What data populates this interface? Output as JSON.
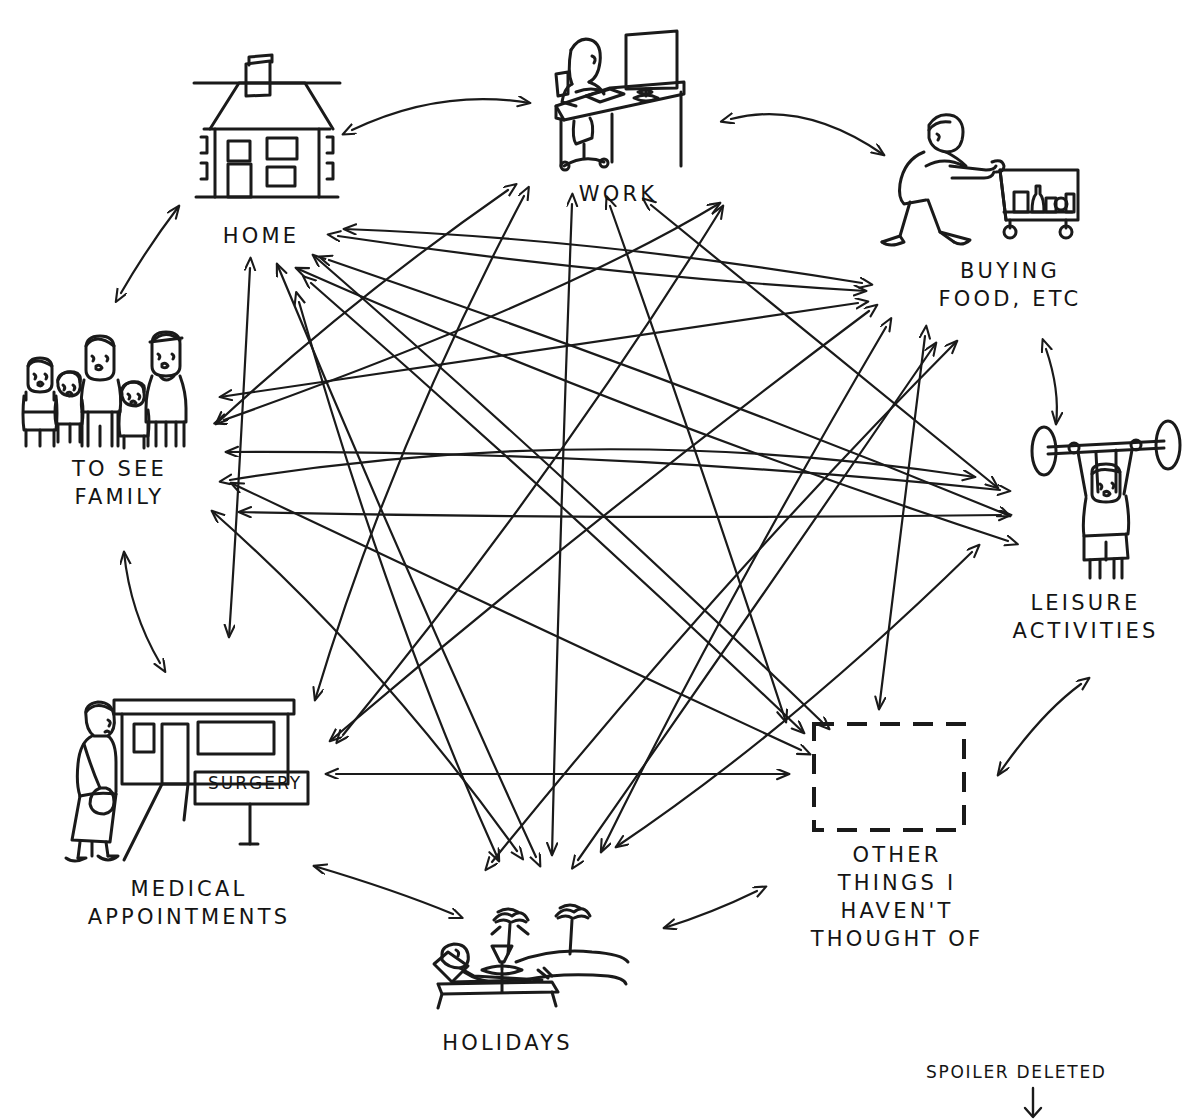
{
  "diagram": {
    "style": "hand-drawn black ink line illustration on white",
    "title_partial": "",
    "layout": "eight nodes arranged in a ring, every node connected to every other node by double-headed arrows",
    "nodes": [
      {
        "id": "home",
        "label": "HOME",
        "icon": "house-icon",
        "label_x": 161,
        "label_y": 222,
        "label_w": 200
      },
      {
        "id": "work",
        "label": "WORK",
        "icon": "person-at-desk-icon",
        "label_x": 513,
        "label_y": 180,
        "label_w": 210
      },
      {
        "id": "buying-food",
        "label": "BUYING\nFOOD, ETC",
        "icon": "shopping-trolley-icon",
        "label_x": 885,
        "label_y": 257,
        "label_w": 250
      },
      {
        "id": "leisure",
        "label": "LEISURE\nACTIVITIES",
        "icon": "weightlifter-icon",
        "label_x": 968,
        "label_y": 589,
        "label_w": 235
      },
      {
        "id": "other",
        "label": "OTHER\nTHINGS I\nHAVEN'T\nTHOUGHT OF",
        "icon": "dashed-empty-box-icon",
        "label_x": 782,
        "label_y": 841,
        "label_w": 230
      },
      {
        "id": "holidays",
        "label": "HOLIDAYS",
        "icon": "beach-lounger-icon",
        "label_x": 380,
        "label_y": 1029,
        "label_w": 255
      },
      {
        "id": "medical",
        "label": "MEDICAL\nAPPOINTMENTS",
        "icon": "surgery-building-icon",
        "label_x": 39,
        "label_y": 875,
        "label_w": 300
      },
      {
        "id": "family",
        "label": "TO SEE\nFAMILY",
        "icon": "family-group-icon",
        "label_x": 12,
        "label_y": 455,
        "label_w": 215
      }
    ],
    "sign_text": "SURGERY",
    "annotation": {
      "text": "SPOILER DELETED",
      "x": 946,
      "y": 1063,
      "arrow": "down-arrow-icon"
    },
    "colors": {
      "ink": "#141414",
      "background": "#ffffff",
      "line": "#1a1a1a"
    }
  }
}
